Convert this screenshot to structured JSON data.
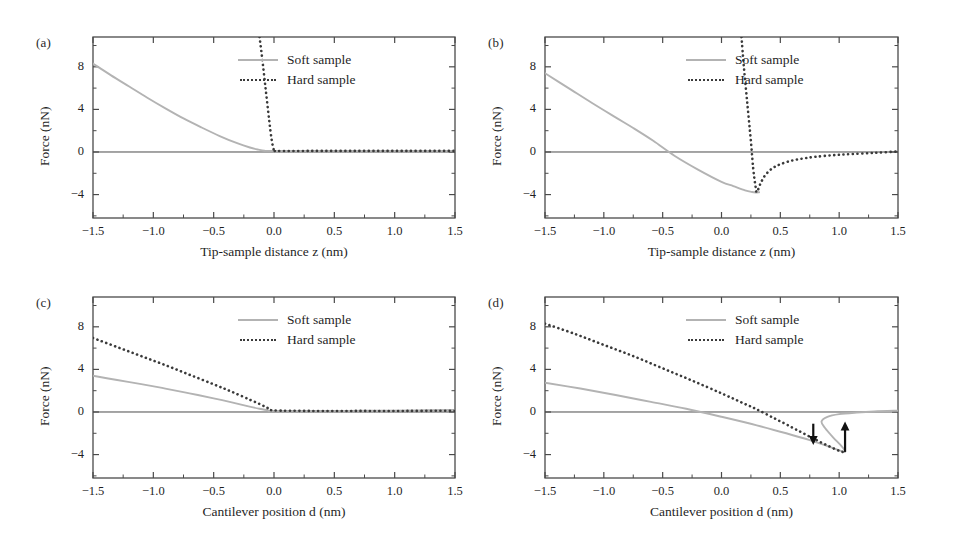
{
  "figure": {
    "background": "#ffffff",
    "soft_color": "#b3b3b3",
    "hard_color": "#3a3a3a",
    "axis_color": "#4a4a4a",
    "arrow_color": "#111111"
  },
  "legend": {
    "soft_label": "Soft sample",
    "hard_label": "Hard sample"
  },
  "panels": [
    {
      "id": "a",
      "label": "(a)",
      "xlabel": "Tip-sample distance z (nm)",
      "ylabel": "Force (nN)"
    },
    {
      "id": "b",
      "label": "(b)",
      "xlabel": "Tip-sample distance z (nm)",
      "ylabel": "Force (nN)"
    },
    {
      "id": "c",
      "label": "(c)",
      "xlabel": "Cantilever position d (nm)",
      "ylabel": "Force (nN)"
    },
    {
      "id": "d",
      "label": "(d)",
      "xlabel": "Cantilever position d (nm)",
      "ylabel": "Force (nN)"
    }
  ],
  "axes": {
    "xticks": [
      -1.5,
      -1.0,
      -0.5,
      0.0,
      0.5,
      1.0,
      1.5
    ],
    "xticklabels": [
      "−1.5",
      "−1.0",
      "−0.5",
      "0.0",
      "0.5",
      "1.0",
      "1.5"
    ],
    "yticks": [
      8,
      4,
      0,
      -4
    ],
    "yticklabels": [
      "8",
      "4",
      "0",
      "−4"
    ],
    "xlim": [
      -1.5,
      1.5
    ],
    "ylim": [
      -6.2,
      10.8
    ],
    "yminor": [
      10,
      6,
      2,
      -2,
      -6
    ]
  },
  "chart_data": [
    {
      "type": "line",
      "panel": "a",
      "title": "(a)",
      "xlabel": "Tip-sample distance z (nm)",
      "ylabel": "Force (nN)",
      "xlim": [
        -1.5,
        1.5
      ],
      "ylim": [
        -6.2,
        10.8
      ],
      "grid": false,
      "legend_position": "upper-right",
      "series": [
        {
          "name": "Soft sample",
          "style": "solid",
          "color": "#b3b3b3",
          "x": [
            -1.5,
            -1.35,
            -1.2,
            -1.05,
            -0.9,
            -0.75,
            -0.6,
            -0.45,
            -0.3,
            -0.2,
            -0.13,
            -0.08,
            0.0,
            0.5,
            1.0,
            1.5
          ],
          "y": [
            8.3,
            7.2,
            6.15,
            5.1,
            4.1,
            3.15,
            2.3,
            1.5,
            0.8,
            0.42,
            0.22,
            0.12,
            0.1,
            0.1,
            0.1,
            0.1
          ]
        },
        {
          "name": "Hard sample",
          "style": "dotted",
          "color": "#3a3a3a",
          "x": [
            -0.12,
            -0.1,
            -0.07,
            -0.04,
            -0.02,
            0.0,
            0.02,
            0.3,
            0.7,
            1.1,
            1.5
          ],
          "y": [
            10.8,
            9.0,
            6.0,
            3.0,
            1.2,
            0.15,
            0.1,
            0.1,
            0.1,
            0.1,
            0.1
          ]
        }
      ]
    },
    {
      "type": "line",
      "panel": "b",
      "title": "(b)",
      "xlabel": "Tip-sample distance z (nm)",
      "ylabel": "Force (nN)",
      "xlim": [
        -1.5,
        1.5
      ],
      "ylim": [
        -6.2,
        10.8
      ],
      "grid": false,
      "legend_position": "upper-right",
      "series": [
        {
          "name": "Soft sample",
          "style": "solid",
          "color": "#b3b3b3",
          "x": [
            -1.5,
            -1.3,
            -1.1,
            -0.9,
            -0.75,
            -0.58,
            -0.4,
            -0.2,
            0.0,
            0.1,
            0.2,
            0.26,
            0.29,
            0.32
          ],
          "y": [
            7.4,
            6.0,
            4.6,
            3.25,
            2.25,
            1.05,
            -0.35,
            -1.65,
            -2.8,
            -3.2,
            -3.6,
            -3.76,
            -3.8,
            -3.78
          ]
        },
        {
          "name": "Hard sample",
          "style": "dotted",
          "color": "#3a3a3a",
          "x": [
            0.17,
            0.19,
            0.22,
            0.25,
            0.27,
            0.29,
            0.3,
            0.33,
            0.37,
            0.43,
            0.5,
            0.6,
            0.7,
            0.8,
            0.95,
            1.1,
            1.3,
            1.5
          ],
          "y": [
            10.8,
            8.0,
            4.5,
            1.0,
            -1.6,
            -3.3,
            -3.78,
            -3.0,
            -2.2,
            -1.55,
            -1.15,
            -0.8,
            -0.6,
            -0.45,
            -0.3,
            -0.2,
            -0.08,
            0.05
          ]
        }
      ],
      "annotations": [
        {
          "text": "soft-sample minimum",
          "x": 0.29,
          "y": -3.8
        },
        {
          "text": "soft-sample zero-crossing",
          "x": -0.58,
          "y": 0.0
        }
      ]
    },
    {
      "type": "line",
      "panel": "c",
      "title": "(c)",
      "xlabel": "Cantilever position d (nm)",
      "ylabel": "Force (nN)",
      "xlim": [
        -1.5,
        1.5
      ],
      "ylim": [
        -6.2,
        10.8
      ],
      "grid": false,
      "legend_position": "upper-right",
      "series": [
        {
          "name": "Soft sample",
          "style": "solid",
          "color": "#b3b3b3",
          "x": [
            -1.5,
            -1.3,
            -1.1,
            -0.9,
            -0.7,
            -0.5,
            -0.35,
            -0.22,
            -0.12,
            -0.05,
            0.0,
            0.4,
            0.8,
            1.2,
            1.5
          ],
          "y": [
            3.4,
            3.0,
            2.62,
            2.2,
            1.75,
            1.28,
            0.9,
            0.55,
            0.3,
            0.15,
            0.1,
            0.1,
            0.12,
            0.15,
            0.2
          ]
        },
        {
          "name": "Hard sample",
          "style": "dotted",
          "color": "#3a3a3a",
          "x": [
            -1.5,
            -1.3,
            -1.1,
            -0.9,
            -0.7,
            -0.5,
            -0.35,
            -0.2,
            -0.1,
            -0.04,
            0.0,
            0.3,
            0.7,
            1.1,
            1.5
          ],
          "y": [
            6.95,
            6.1,
            5.25,
            4.4,
            3.5,
            2.6,
            1.9,
            1.15,
            0.65,
            0.3,
            0.15,
            0.1,
            0.1,
            0.1,
            0.12
          ]
        }
      ]
    },
    {
      "type": "line",
      "panel": "d",
      "title": "(d)",
      "xlabel": "Cantilever position d (nm)",
      "ylabel": "Force (nN)",
      "xlim": [
        -1.5,
        1.5
      ],
      "ylim": [
        -6.2,
        10.8
      ],
      "grid": false,
      "legend_position": "upper-right",
      "series": [
        {
          "name": "Soft sample",
          "style": "solid",
          "color": "#b3b3b3",
          "comment": "S-shaped multivalued branch; upper approach branch then lower retract branch",
          "x": [
            -1.5,
            -1.2,
            -0.9,
            -0.6,
            -0.3,
            0.0,
            0.3,
            0.55,
            0.75,
            0.9,
            1.0,
            1.05,
            1.02,
            0.95,
            0.88,
            0.85,
            0.9,
            1.0,
            1.15,
            1.3,
            1.5
          ],
          "y": [
            2.75,
            2.2,
            1.6,
            0.95,
            0.3,
            -0.45,
            -1.25,
            -2.0,
            -2.65,
            -3.2,
            -3.6,
            -3.75,
            -3.2,
            -2.4,
            -1.5,
            -0.9,
            -0.45,
            -0.2,
            -0.05,
            0.05,
            0.12
          ]
        },
        {
          "name": "Hard sample",
          "style": "dotted",
          "color": "#3a3a3a",
          "x": [
            -1.5,
            -1.25,
            -1.0,
            -0.75,
            -0.5,
            -0.25,
            0.0,
            0.2,
            0.3,
            0.45,
            0.6,
            0.72,
            0.8,
            0.9,
            1.0,
            1.05
          ],
          "y": [
            8.3,
            7.35,
            6.3,
            5.25,
            4.1,
            2.95,
            1.75,
            0.75,
            0.25,
            -0.6,
            -1.45,
            -2.15,
            -2.6,
            -3.15,
            -3.65,
            -3.8
          ]
        }
      ],
      "annotations": [
        {
          "text": "snap-in arrow (downward)",
          "x": 0.78,
          "y_from": -1.1,
          "y_to": -3.1,
          "direction": "down"
        },
        {
          "text": "snap-out arrow (upward)",
          "x": 1.05,
          "y_from": -3.75,
          "y_to": -0.9,
          "direction": "up"
        }
      ]
    }
  ]
}
